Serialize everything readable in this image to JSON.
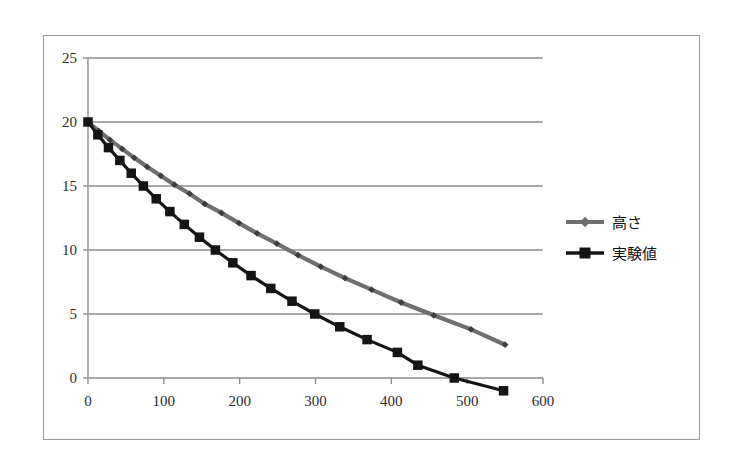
{
  "chart_data": {
    "type": "line",
    "title": "",
    "subtitle": "",
    "xlabel": "",
    "ylabel": "",
    "xlim": [
      0,
      600
    ],
    "ylim": [
      0,
      25
    ],
    "x_ticks": [
      0,
      100,
      200,
      300,
      400,
      500,
      600
    ],
    "y_ticks": [
      0,
      5,
      10,
      15,
      20,
      25
    ],
    "x_tick_labels": [
      "0",
      "100",
      "200",
      "300",
      "400",
      "500",
      "600"
    ],
    "y_tick_labels": [
      "0",
      "5",
      "10",
      "15",
      "20",
      "25"
    ],
    "grid": "horizontal",
    "legend_position": "right",
    "series": [
      {
        "name": "高さ",
        "marker": "diamond",
        "color": "#6f6f6f",
        "x": [
          0,
          14,
          29,
          45,
          61,
          78,
          96,
          114,
          134,
          154,
          176,
          199,
          223,
          249,
          277,
          307,
          339,
          374,
          413,
          456,
          505,
          550
        ],
        "y": [
          20.0,
          19.3,
          18.6,
          17.9,
          17.2,
          16.5,
          15.8,
          15.1,
          14.4,
          13.6,
          12.9,
          12.1,
          11.3,
          10.5,
          9.6,
          8.7,
          7.8,
          6.9,
          5.9,
          4.9,
          3.8,
          2.6
        ]
      },
      {
        "name": "実験値",
        "marker": "square",
        "color": "#141414",
        "x": [
          0,
          13,
          27,
          42,
          57,
          73,
          90,
          108,
          127,
          147,
          168,
          191,
          215,
          241,
          269,
          299,
          332,
          368,
          408,
          435,
          483,
          548
        ],
        "y": [
          20,
          19,
          18,
          17,
          16,
          15,
          14,
          13,
          12,
          11,
          10,
          9,
          8,
          7,
          6,
          5,
          4,
          3,
          20,
          19,
          18,
          17
        ]
      }
    ],
    "experimental_points": {
      "x": [
        0,
        13,
        27,
        42,
        57,
        73,
        90,
        108,
        127,
        147,
        168,
        191,
        215,
        241,
        269,
        299,
        332,
        368,
        408,
        435,
        483,
        548
      ],
      "y": [
        20,
        19,
        18,
        17,
        16,
        15,
        14,
        13,
        12,
        11,
        10,
        9,
        8,
        7,
        6,
        5,
        4,
        3,
        20,
        19,
        18,
        17
      ]
    }
  },
  "legend": {
    "entries": [
      {
        "label": "高さ",
        "marker": "diamond-marker-icon",
        "color": "#6f6f6f"
      },
      {
        "label": "実験値",
        "marker": "square-marker-icon",
        "color": "#141414"
      }
    ]
  },
  "axes": {
    "x_labels": [
      "0",
      "100",
      "200",
      "300",
      "400",
      "500",
      "600"
    ],
    "y_labels": [
      "0",
      "5",
      "10",
      "15",
      "20",
      "25"
    ]
  }
}
